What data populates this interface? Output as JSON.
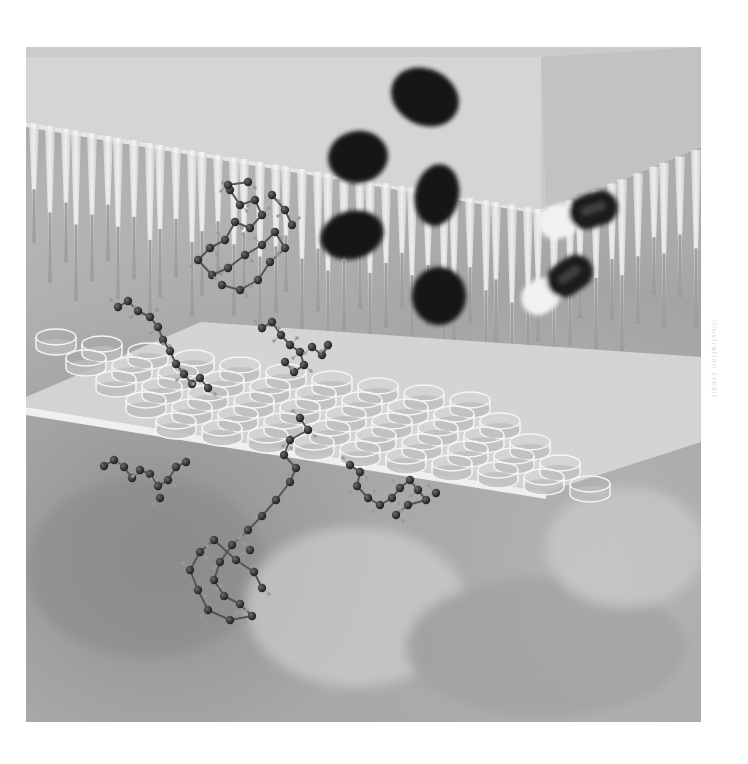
{
  "image": {
    "subject": "Illustration: pipette tips above a multi-well plate, falling pills and capsules, floating ball-and-stick molecules",
    "style": "grayscale",
    "frame": {
      "x": 26,
      "y": 47,
      "width": 675,
      "height": 675
    },
    "colors": {
      "background_dark": "#8f8f8f",
      "background_mid": "#b5b5b5",
      "background_light": "#d2d2d2",
      "block_top": "#cfcfcf",
      "block_front": "#dedede",
      "block_side": "#c4c4c4",
      "pipette": "#f0f0f0",
      "pipette_tip": "#7d7d7d",
      "well": "#e3e3e3",
      "well_liquid": "#bdbdbd",
      "pill": "#141414",
      "atom": "#2a2a2a",
      "hydrogen": "#9a9a9a",
      "bond": "#555555"
    }
  },
  "pills": [
    {
      "cx": 425,
      "cy": 97,
      "rx": 35,
      "ry": 28,
      "rot": 25
    },
    {
      "cx": 358,
      "cy": 157,
      "rx": 30,
      "ry": 26,
      "rot": -10
    },
    {
      "cx": 352,
      "cy": 235,
      "rx": 32,
      "ry": 24,
      "rot": -15
    },
    {
      "cx": 437,
      "cy": 195,
      "rx": 22,
      "ry": 31,
      "rot": 10
    },
    {
      "cx": 439,
      "cy": 296,
      "rx": 27,
      "ry": 29,
      "rot": 0
    }
  ],
  "capsules": [
    {
      "cx": 578,
      "cy": 215,
      "len": 82,
      "w": 34,
      "rot": -18
    },
    {
      "cx": 557,
      "cy": 285,
      "len": 80,
      "w": 34,
      "rot": -35
    }
  ],
  "wells": {
    "rows": 5,
    "cols": 10
  },
  "molecules": [
    {
      "name": "molecule-upper-left",
      "atoms": [
        [
          230,
          190
        ],
        [
          240,
          205
        ],
        [
          255,
          200
        ],
        [
          262,
          215
        ],
        [
          250,
          228
        ],
        [
          235,
          222
        ],
        [
          225,
          240
        ],
        [
          210,
          248
        ],
        [
          198,
          260
        ],
        [
          212,
          275
        ],
        [
          228,
          268
        ],
        [
          245,
          255
        ],
        [
          262,
          245
        ],
        [
          275,
          232
        ],
        [
          285,
          248
        ],
        [
          270,
          262
        ],
        [
          258,
          280
        ],
        [
          240,
          290
        ],
        [
          222,
          285
        ],
        [
          272,
          195
        ],
        [
          285,
          210
        ],
        [
          292,
          225
        ],
        [
          228,
          185
        ],
        [
          248,
          182
        ]
      ]
    },
    {
      "name": "molecule-chain-left",
      "atoms": [
        [
          118,
          307
        ],
        [
          128,
          301
        ],
        [
          138,
          311
        ],
        [
          150,
          317
        ],
        [
          158,
          327
        ],
        [
          163,
          340
        ],
        [
          170,
          351
        ],
        [
          176,
          364
        ],
        [
          184,
          374
        ],
        [
          192,
          384
        ],
        [
          200,
          378
        ],
        [
          208,
          388
        ]
      ]
    },
    {
      "name": "molecule-center-plate",
      "atoms": [
        [
          262,
          328
        ],
        [
          272,
          322
        ],
        [
          281,
          335
        ],
        [
          290,
          345
        ],
        [
          300,
          352
        ],
        [
          304,
          365
        ],
        [
          294,
          372
        ],
        [
          285,
          362
        ],
        [
          312,
          347
        ],
        [
          322,
          355
        ],
        [
          328,
          345
        ]
      ]
    },
    {
      "name": "molecule-lower-left",
      "atoms": [
        [
          104,
          466
        ],
        [
          114,
          460
        ],
        [
          124,
          467
        ],
        [
          132,
          478
        ],
        [
          140,
          470
        ],
        [
          150,
          474
        ],
        [
          158,
          486
        ],
        [
          168,
          480
        ],
        [
          176,
          467
        ],
        [
          186,
          462
        ],
        [
          160,
          498
        ]
      ]
    },
    {
      "name": "molecule-lower-center",
      "atoms": [
        [
          300,
          418
        ],
        [
          308,
          430
        ],
        [
          290,
          440
        ],
        [
          284,
          455
        ],
        [
          296,
          468
        ],
        [
          290,
          482
        ],
        [
          276,
          500
        ],
        [
          262,
          516
        ],
        [
          248,
          530
        ],
        [
          232,
          545
        ],
        [
          220,
          562
        ],
        [
          214,
          580
        ],
        [
          224,
          596
        ],
        [
          240,
          604
        ],
        [
          252,
          616
        ],
        [
          230,
          620
        ],
        [
          208,
          610
        ],
        [
          198,
          590
        ],
        [
          190,
          570
        ],
        [
          200,
          552
        ],
        [
          214,
          540
        ],
        [
          236,
          560
        ],
        [
          254,
          572
        ],
        [
          262,
          588
        ],
        [
          250,
          550
        ]
      ]
    },
    {
      "name": "molecule-lower-right",
      "atoms": [
        [
          350,
          465
        ],
        [
          360,
          472
        ],
        [
          357,
          486
        ],
        [
          368,
          498
        ],
        [
          380,
          505
        ],
        [
          392,
          498
        ],
        [
          400,
          488
        ],
        [
          410,
          480
        ],
        [
          418,
          490
        ],
        [
          426,
          500
        ],
        [
          408,
          505
        ],
        [
          396,
          515
        ],
        [
          436,
          493
        ]
      ]
    }
  ],
  "side_text": "illustration credit"
}
